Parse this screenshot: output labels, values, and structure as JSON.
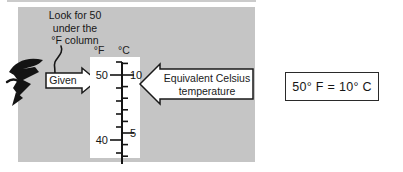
{
  "panel": {
    "note": {
      "lines": [
        "Look for 50",
        "under the",
        "°F column"
      ]
    },
    "given_arrow_label": "Given",
    "equivalent_arrow": {
      "line1": "Equivalent Celsius",
      "line2": "temperature"
    }
  },
  "thermometer": {
    "fahrenheit_header": "°F",
    "celsius_header": "°C",
    "fahrenheit_major_labels": [
      "50",
      "40"
    ],
    "celsius_major_labels": [
      "10",
      "5"
    ],
    "scale": {
      "fahrenheit_range": [
        38,
        52
      ],
      "fahrenheit_tick_step": 2,
      "fahrenheit_major_every": 10,
      "celsius_range": [
        3,
        11
      ],
      "celsius_tick_step": 1,
      "celsius_major_every": 5,
      "highlight_pair": {
        "fahrenheit": 50,
        "celsius": 10
      }
    }
  },
  "result_box": {
    "text": "50° F = 10° C"
  },
  "colors": {
    "panel_bg": "#c5c5c5",
    "shape_fill": "#ffffff",
    "outline": "#1a1a1a"
  }
}
